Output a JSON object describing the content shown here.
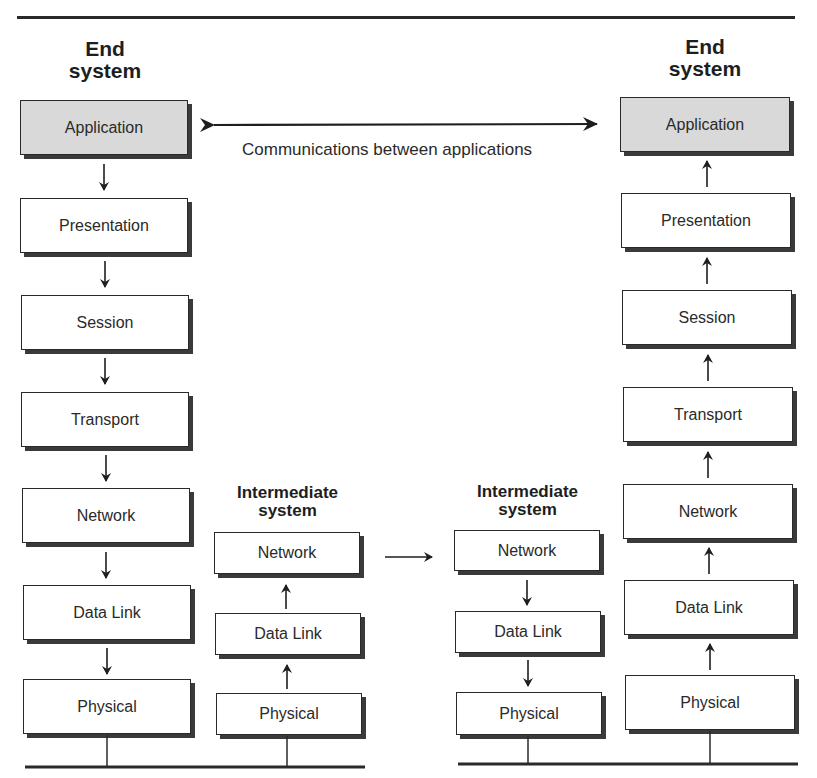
{
  "figure": {
    "left_end_system": {
      "title_line1": "End",
      "title_line2": "system",
      "layers": [
        "Application",
        "Presentation",
        "Session",
        "Transport",
        "Network",
        "Data Link",
        "Physical"
      ],
      "flow": "down"
    },
    "right_end_system": {
      "title_line1": "End",
      "title_line2": "system",
      "layers": [
        "Application",
        "Presentation",
        "Session",
        "Transport",
        "Network",
        "Data Link",
        "Physical"
      ],
      "flow": "up"
    },
    "intermediate_system_1": {
      "title_line1": "Intermediate",
      "title_line2": "system",
      "layers": [
        "Network",
        "Data Link",
        "Physical"
      ],
      "flow": "up"
    },
    "intermediate_system_2": {
      "title_line1": "Intermediate",
      "title_line2": "system",
      "layers": [
        "Network",
        "Data Link",
        "Physical"
      ],
      "flow": "down"
    },
    "application_link_label": "Communications between applications",
    "colors": {
      "application_fill": "#d9d9d9",
      "box_fill": "#ffffff",
      "stroke": "#2a2a2a"
    }
  }
}
